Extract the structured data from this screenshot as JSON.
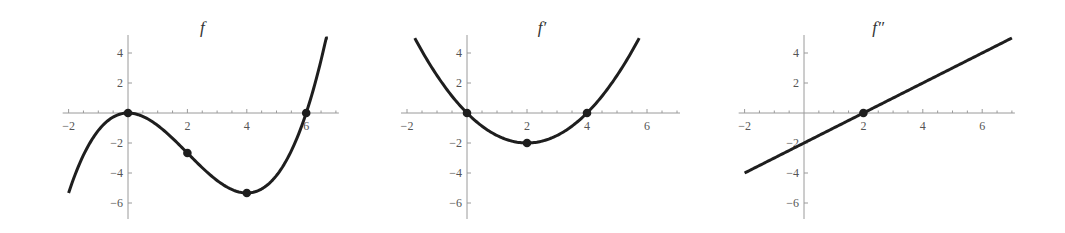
{
  "chart_data": [
    {
      "type": "line",
      "title": "f",
      "function": "x^3/6 - x^2",
      "xlabel": "",
      "ylabel": "",
      "xlim": [
        -2.2,
        7.1
      ],
      "ylim": [
        -7,
        5
      ],
      "xticks": [
        -2,
        2,
        4,
        6
      ],
      "yticks": [
        -6,
        -4,
        -2,
        2,
        4
      ],
      "grid": false,
      "series": [
        {
          "name": "f",
          "x": [
            -2,
            -1,
            0,
            1,
            2,
            3,
            4,
            5,
            6,
            6.5,
            6.73
          ],
          "y": [
            -5.33,
            -1.17,
            0,
            -0.83,
            -2.67,
            -4.5,
            -5.33,
            -4.17,
            0,
            3.52,
            5
          ]
        }
      ],
      "marked_points": [
        {
          "x": 0,
          "y": 0,
          "label": "local max"
        },
        {
          "x": 2,
          "y": -2.67,
          "label": "inflection point"
        },
        {
          "x": 4,
          "y": -5.33,
          "label": "local min"
        },
        {
          "x": 6,
          "y": 0,
          "label": "zero"
        }
      ],
      "origin_px": [
        128,
        113
      ],
      "px_per_unit": [
        29.7,
        15
      ]
    },
    {
      "type": "line",
      "title": "f′",
      "function": "x^2/2 - 2x",
      "xlabel": "",
      "ylabel": "",
      "xlim": [
        -2.2,
        7.1
      ],
      "ylim": [
        -7,
        5
      ],
      "xticks": [
        -2,
        2,
        4,
        6
      ],
      "yticks": [
        -6,
        -4,
        -2,
        2,
        4
      ],
      "grid": false,
      "series": [
        {
          "name": "f′",
          "x": [
            -1.74,
            -1,
            0,
            1,
            2,
            3,
            4,
            5,
            5.74
          ],
          "y": [
            5,
            2.5,
            0,
            -1.5,
            -2,
            -1.5,
            0,
            2.5,
            5
          ]
        }
      ],
      "marked_points": [
        {
          "x": 0,
          "y": 0,
          "label": "zero"
        },
        {
          "x": 2,
          "y": -2,
          "label": "minimum"
        },
        {
          "x": 4,
          "y": 0,
          "label": "zero"
        }
      ],
      "origin_px": [
        467,
        113
      ],
      "px_per_unit": [
        30,
        15
      ]
    },
    {
      "type": "line",
      "title": "f″",
      "function": "x - 2",
      "xlabel": "",
      "ylabel": "",
      "xlim": [
        -2.2,
        7.1
      ],
      "ylim": [
        -7,
        5
      ],
      "xticks": [
        -2,
        2,
        4,
        6
      ],
      "yticks": [
        -6,
        -4,
        -2,
        2,
        4
      ],
      "grid": false,
      "series": [
        {
          "name": "f″",
          "x": [
            -2,
            0,
            2,
            4,
            6,
            7
          ],
          "y": [
            -4,
            -2,
            0,
            2,
            4,
            5
          ]
        }
      ],
      "marked_points": [
        {
          "x": 2,
          "y": 0,
          "label": "zero"
        }
      ],
      "origin_px": [
        804,
        113
      ],
      "px_per_unit": [
        29.7,
        15
      ]
    }
  ],
  "colors": {
    "curve": "#1e1e1e",
    "axis": "#9a9a9a",
    "tick_label": "#555555",
    "title": "#333333"
  }
}
